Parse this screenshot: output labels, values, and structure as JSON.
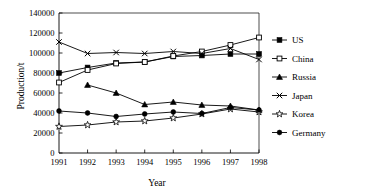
{
  "chart_data": {
    "type": "line",
    "title": "",
    "xlabel": "Year",
    "ylabel": "Production/t",
    "x": [
      1991,
      1992,
      1993,
      1994,
      1995,
      1996,
      1997,
      1998
    ],
    "categories": [
      "1991",
      "1992",
      "1993",
      "1994",
      "1995",
      "1996",
      "1997",
      "1998"
    ],
    "xlim": [
      1991,
      1998
    ],
    "ylim": [
      0,
      140000
    ],
    "ytick_labels": [
      "0",
      "20000",
      "40000",
      "60000",
      "80000",
      "100000",
      "120000",
      "140000"
    ],
    "yticks": [
      0,
      20000,
      40000,
      60000,
      80000,
      100000,
      120000,
      140000
    ],
    "grid": false,
    "legend_position": "right",
    "series": [
      {
        "name": "US",
        "marker": "filled-square",
        "color": "#000000",
        "x": [
          1991,
          1992,
          1993,
          1994,
          1995,
          1996,
          1997,
          1998
        ],
        "values": [
          80000,
          85500,
          90000,
          91000,
          96500,
          97500,
          99000,
          99000
        ]
      },
      {
        "name": "China",
        "marker": "open-square",
        "color": "#000000",
        "x": [
          1991,
          1992,
          1993,
          1994,
          1995,
          1996,
          1997,
          1998
        ],
        "values": [
          70500,
          83000,
          89500,
          91000,
          97000,
          101500,
          108000,
          115500
        ]
      },
      {
        "name": "Russia",
        "marker": "filled-triangle",
        "color": "#000000",
        "x": [
          1992,
          1993,
          1994,
          1995,
          1996,
          1997,
          1998
        ],
        "values": [
          68000,
          60000,
          48500,
          51000,
          48000,
          47000,
          43000
        ]
      },
      {
        "name": "Japan",
        "marker": "cross-x",
        "color": "#000000",
        "x": [
          1991,
          1992,
          1993,
          1994,
          1995,
          1996,
          1997,
          1998
        ],
        "values": [
          111000,
          99500,
          100500,
          99500,
          101500,
          99500,
          104500,
          93500
        ]
      },
      {
        "name": "Korea",
        "marker": "open-star",
        "color": "#000000",
        "x": [
          1991,
          1992,
          1993,
          1994,
          1995,
          1996,
          1997,
          1998
        ],
        "values": [
          26500,
          28000,
          31000,
          32000,
          35000,
          39000,
          44000,
          41000
        ]
      },
      {
        "name": "Germany",
        "marker": "filled-circle",
        "color": "#000000",
        "x": [
          1991,
          1992,
          1993,
          1994,
          1995,
          1996,
          1997,
          1998
        ],
        "values": [
          42000,
          40000,
          36500,
          39000,
          41000,
          39500,
          45500,
          43000
        ]
      }
    ]
  },
  "axes": {
    "xlabel": "Year",
    "ylabel": "Production/t"
  },
  "legend": {
    "items": [
      {
        "label": "US",
        "marker": "filled-square"
      },
      {
        "label": "China",
        "marker": "open-square"
      },
      {
        "label": "Russia",
        "marker": "filled-triangle"
      },
      {
        "label": "Japan",
        "marker": "cross-x"
      },
      {
        "label": "Korea",
        "marker": "open-star"
      },
      {
        "label": "Germany",
        "marker": "filled-circle"
      }
    ]
  }
}
